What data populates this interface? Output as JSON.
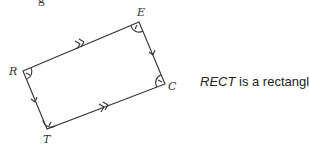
{
  "figure": {
    "top_partial_text": "g",
    "vertices": [
      {
        "label": "R",
        "x": 23,
        "y": 71
      },
      {
        "label": "E",
        "x": 139,
        "y": 22
      },
      {
        "label": "C",
        "x": 165,
        "y": 84
      },
      {
        "label": "T",
        "x": 47,
        "y": 129
      }
    ],
    "markings": {
      "RE": "double-arrow",
      "TC": "double-arrow",
      "EC": "single-arrow",
      "RT": "single-arrow",
      "right_angles": [
        "R",
        "E",
        "C",
        "T"
      ]
    },
    "stroke_color": "#333333"
  },
  "caption": {
    "name": "RECT",
    "rest": " is a rectangle."
  }
}
